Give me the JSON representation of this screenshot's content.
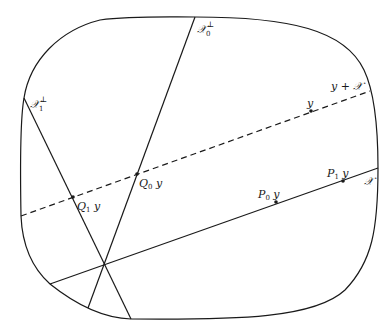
{
  "diagram": {
    "boundary": {
      "shape": "rounded-rectangle (superellipse)",
      "bounds": {
        "left": 21,
        "top": 17,
        "right": 378,
        "bottom": 320
      }
    },
    "lines": [
      {
        "id": "X",
        "style": "solid",
        "label": "𝒳",
        "from": [
          50,
          284
        ],
        "to": [
          378,
          168
        ]
      },
      {
        "id": "y_plus_X",
        "style": "dashed",
        "label": "y + 𝒳",
        "from": [
          21,
          216
        ],
        "to": [
          370,
          91
        ]
      },
      {
        "id": "X0_perp",
        "style": "solid",
        "label_base": "𝒳",
        "label_sub": "0",
        "label_sup": "⊥",
        "from": [
          195,
          17
        ],
        "to": [
          88,
          308
        ]
      },
      {
        "id": "X1_perp",
        "style": "solid",
        "label_base": "𝒳",
        "label_sub": "1",
        "label_sup": "⊥",
        "from": [
          24,
          98
        ],
        "to": [
          131,
          319
        ]
      }
    ],
    "points": [
      {
        "id": "y",
        "label": "y",
        "x": 311,
        "y": 111
      },
      {
        "id": "Q0y",
        "label_base": "Q",
        "label_sub": "0",
        "label_tail": " y",
        "x": 137,
        "y": 174
      },
      {
        "id": "Q1y",
        "label_base": "Q",
        "label_sub": "1",
        "label_tail": " y",
        "x": 73,
        "y": 197
      },
      {
        "id": "P0y",
        "label_base": "P",
        "label_sub": "0",
        "label_tail": " y",
        "x": 276,
        "y": 202
      },
      {
        "id": "P1y",
        "label_base": "P",
        "label_sub": "1",
        "label_tail": " y",
        "x": 343,
        "y": 181
      }
    ],
    "intersection": {
      "id": "origin",
      "x": 104,
      "y": 264
    }
  },
  "labels": {
    "X0_perp": {
      "base": "𝒳",
      "sub": "0",
      "sup": "⊥"
    },
    "X1_perp": {
      "base": "𝒳",
      "sub": "1",
      "sup": "⊥"
    },
    "y_plus_X": "y + 𝒳",
    "X": "𝒳",
    "y": "y",
    "Q0y": {
      "base": "Q",
      "sub": "0",
      "tail": " y"
    },
    "Q1y": {
      "base": "Q",
      "sub": "1",
      "tail": " y"
    },
    "P0y": {
      "base": "P",
      "sub": "0",
      "tail": " y"
    },
    "P1y": {
      "base": "P",
      "sub": "1",
      "tail": " y"
    }
  }
}
